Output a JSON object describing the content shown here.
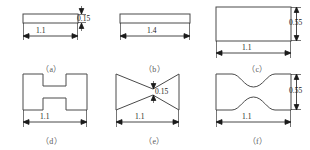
{
  "figure": {
    "background_color": "#ffffff",
    "line_color": "#4a4a4a",
    "dim_line_color": "#1a1a1a",
    "caption_color": "#5a5a5a"
  },
  "panels": [
    {
      "id": "a",
      "caption": "（a）",
      "shape": "thin-rectangle",
      "width_label": "1.1",
      "thickness_label": "0.15",
      "has_width_dim": true,
      "has_height_dim": true
    },
    {
      "id": "b",
      "caption": "（b）",
      "shape": "thin-rectangle",
      "width_label": "1.4",
      "thickness_label": "",
      "has_width_dim": true,
      "has_height_dim": false
    },
    {
      "id": "c",
      "caption": "（c）",
      "shape": "tall-rectangle",
      "width_label": "1.1",
      "thickness_label": "0.55",
      "has_width_dim": true,
      "has_height_dim": true
    },
    {
      "id": "d",
      "caption": "（d）",
      "shape": "h-beam",
      "width_label": "1.1",
      "thickness_label": "",
      "has_width_dim": true,
      "has_height_dim": false
    },
    {
      "id": "e",
      "caption": "（e）",
      "shape": "bowtie",
      "width_label": "1.1",
      "thickness_label": "0.15",
      "has_width_dim": true,
      "has_height_dim": true
    },
    {
      "id": "f",
      "caption": "（f）",
      "shape": "dogbone",
      "width_label": "1.1",
      "thickness_label": "0.55",
      "has_width_dim": true,
      "has_height_dim": true
    }
  ]
}
